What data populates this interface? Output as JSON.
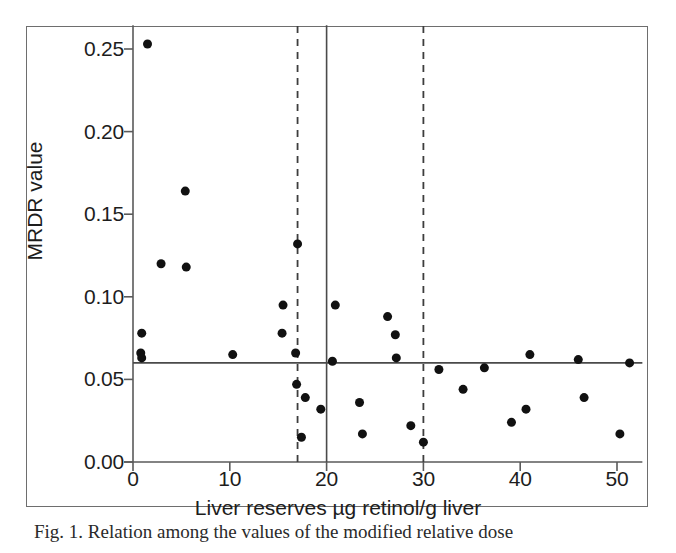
{
  "figure": {
    "caption_fragment": "Fig. 1.  Relation among the values of the modified relative dose"
  },
  "chart_data": {
    "type": "scatter",
    "title": "",
    "xlabel": "Liver reserves µg retinol/g liver",
    "ylabel": "MRDR value",
    "xlim": [
      0,
      52
    ],
    "ylim": [
      0.0,
      0.262
    ],
    "xticks": [
      0,
      10,
      20,
      30,
      40,
      50
    ],
    "xtick_labels": [
      "0",
      "10",
      "20",
      "30",
      "40",
      "50"
    ],
    "yticks": [
      0.0,
      0.05,
      0.1,
      0.15,
      0.2,
      0.25
    ],
    "ytick_labels": [
      "0.00",
      "0.05",
      "0.10",
      "0.15",
      "0.20",
      "0.25"
    ],
    "grid": false,
    "legend": false,
    "marker": {
      "shape": "circle",
      "color": "#111111",
      "size_px": 9
    },
    "reference_lines": [
      {
        "name": "mrdr-cutoff-horizontal",
        "orientation": "horizontal",
        "value": 0.06,
        "style": "solid",
        "color": "#4a4a4a"
      },
      {
        "name": "liver-reserve-cutoff-20",
        "orientation": "vertical",
        "value": 20,
        "style": "solid",
        "color": "#4a4a4a"
      },
      {
        "name": "liver-reserve-lower-dashed-17",
        "orientation": "vertical",
        "value": 17,
        "style": "dashed",
        "color": "#3d3d3d"
      },
      {
        "name": "liver-reserve-upper-dashed-30",
        "orientation": "vertical",
        "value": 30,
        "style": "dashed",
        "color": "#3d3d3d"
      }
    ],
    "points": [
      {
        "x": 1.5,
        "y": 0.253
      },
      {
        "x": 5.4,
        "y": 0.164
      },
      {
        "x": 2.9,
        "y": 0.12
      },
      {
        "x": 5.5,
        "y": 0.118
      },
      {
        "x": 17.0,
        "y": 0.132
      },
      {
        "x": 15.5,
        "y": 0.095
      },
      {
        "x": 20.9,
        "y": 0.095
      },
      {
        "x": 26.3,
        "y": 0.088
      },
      {
        "x": 0.9,
        "y": 0.078
      },
      {
        "x": 15.4,
        "y": 0.078
      },
      {
        "x": 27.1,
        "y": 0.077
      },
      {
        "x": 0.8,
        "y": 0.066
      },
      {
        "x": 0.9,
        "y": 0.063
      },
      {
        "x": 10.3,
        "y": 0.065
      },
      {
        "x": 16.8,
        "y": 0.066
      },
      {
        "x": 41.0,
        "y": 0.065
      },
      {
        "x": 20.6,
        "y": 0.061
      },
      {
        "x": 27.2,
        "y": 0.063
      },
      {
        "x": 46.0,
        "y": 0.062
      },
      {
        "x": 51.3,
        "y": 0.06
      },
      {
        "x": 31.6,
        "y": 0.056
      },
      {
        "x": 36.3,
        "y": 0.057
      },
      {
        "x": 16.9,
        "y": 0.047
      },
      {
        "x": 34.1,
        "y": 0.044
      },
      {
        "x": 17.8,
        "y": 0.039
      },
      {
        "x": 46.6,
        "y": 0.039
      },
      {
        "x": 23.4,
        "y": 0.036
      },
      {
        "x": 19.4,
        "y": 0.032
      },
      {
        "x": 40.6,
        "y": 0.032
      },
      {
        "x": 39.1,
        "y": 0.024
      },
      {
        "x": 28.7,
        "y": 0.022
      },
      {
        "x": 23.7,
        "y": 0.017
      },
      {
        "x": 50.3,
        "y": 0.017
      },
      {
        "x": 17.4,
        "y": 0.015
      },
      {
        "x": 30.0,
        "y": 0.012
      }
    ]
  }
}
